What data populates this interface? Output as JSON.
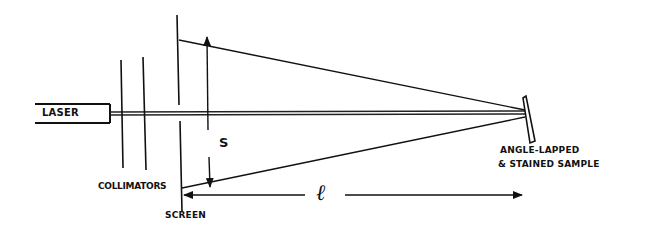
{
  "figure": {
    "type": "optical-setup-schematic",
    "labels": {
      "laser": "LASER",
      "collimators": "COLLIMATORS",
      "screen": "SCREEN",
      "separation": "S",
      "distance": "ℓ",
      "sample_line1": "ANGLE-LAPPED",
      "sample_line2": "& STAINED SAMPLE"
    },
    "components": [
      {
        "name": "laser",
        "label": "LASER"
      },
      {
        "name": "collimators",
        "label": "COLLIMATORS",
        "count": 2
      },
      {
        "name": "screen",
        "label": "SCREEN"
      },
      {
        "name": "sample",
        "label": "ANGLE-LAPPED & STAINED SAMPLE"
      }
    ],
    "dimensions": [
      {
        "symbol": "S",
        "meaning": "spot separation on screen"
      },
      {
        "symbol": "ℓ",
        "meaning": "screen-to-sample distance"
      }
    ],
    "colors": {
      "ink": "#111111",
      "background": "#ffffff"
    }
  }
}
